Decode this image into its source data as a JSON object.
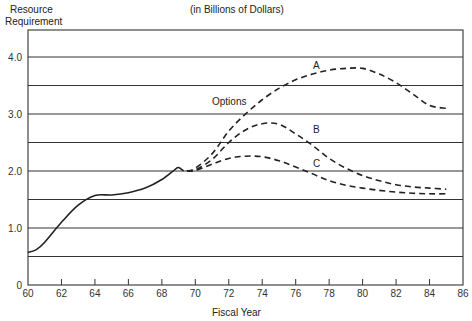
{
  "chart_data": {
    "type": "line",
    "title": "",
    "subtitle": "(in Billions of Dollars)",
    "ylabel": "Resource Requirement",
    "xlabel": "Fiscal Year",
    "xlim": [
      60,
      86
    ],
    "ylim": [
      0,
      4.5
    ],
    "x_ticks": [
      "60",
      "62",
      "64",
      "66",
      "68",
      "70",
      "72",
      "74",
      "76",
      "78",
      "80",
      "82",
      "84",
      "86"
    ],
    "y_ticks": [
      "0",
      "1.0",
      "2.0",
      "3.0",
      "4.0"
    ],
    "grid": "horizontal lines every 0.5",
    "annotations": [
      "Options",
      "A",
      "B",
      "C"
    ],
    "series": [
      {
        "name": "Historical",
        "style": "solid",
        "x": [
          60,
          60.5,
          61,
          62,
          63,
          64,
          65,
          66,
          67,
          68,
          68.8,
          69,
          69.3
        ],
        "y": [
          0.57,
          0.62,
          0.75,
          1.1,
          1.4,
          1.57,
          1.58,
          1.62,
          1.7,
          1.85,
          2.03,
          2.06,
          2.0
        ]
      },
      {
        "name": "A",
        "style": "dashed",
        "x": [
          69.5,
          70,
          71,
          72,
          73,
          74,
          75,
          76,
          77,
          78,
          79,
          80,
          81,
          82,
          83,
          84,
          85
        ],
        "y": [
          2.0,
          2.05,
          2.3,
          2.7,
          3.0,
          3.25,
          3.45,
          3.6,
          3.7,
          3.77,
          3.8,
          3.8,
          3.7,
          3.55,
          3.35,
          3.15,
          3.1
        ]
      },
      {
        "name": "B",
        "style": "dashed",
        "x": [
          69.5,
          70,
          71,
          72,
          73,
          74,
          75,
          76,
          77,
          78,
          79,
          80,
          81,
          82,
          83,
          84,
          85
        ],
        "y": [
          2.0,
          2.02,
          2.2,
          2.5,
          2.72,
          2.83,
          2.82,
          2.65,
          2.45,
          2.22,
          2.05,
          1.92,
          1.83,
          1.76,
          1.72,
          1.7,
          1.68
        ]
      },
      {
        "name": "C",
        "style": "dashed",
        "x": [
          69.5,
          70,
          71,
          72,
          73,
          74,
          75,
          76,
          77,
          78,
          79,
          80,
          81,
          82,
          83,
          84,
          85
        ],
        "y": [
          2.0,
          2.01,
          2.12,
          2.22,
          2.26,
          2.25,
          2.18,
          2.07,
          1.95,
          1.83,
          1.75,
          1.7,
          1.66,
          1.63,
          1.61,
          1.6,
          1.6
        ]
      }
    ]
  },
  "labels": {
    "ylabel_line1": "Resource",
    "ylabel_line2": "Requirement",
    "subtitle": "(in Billions of Dollars)",
    "xlabel": "Fiscal Year",
    "options": "Options",
    "a": "A",
    "b": "B",
    "c": "C"
  }
}
